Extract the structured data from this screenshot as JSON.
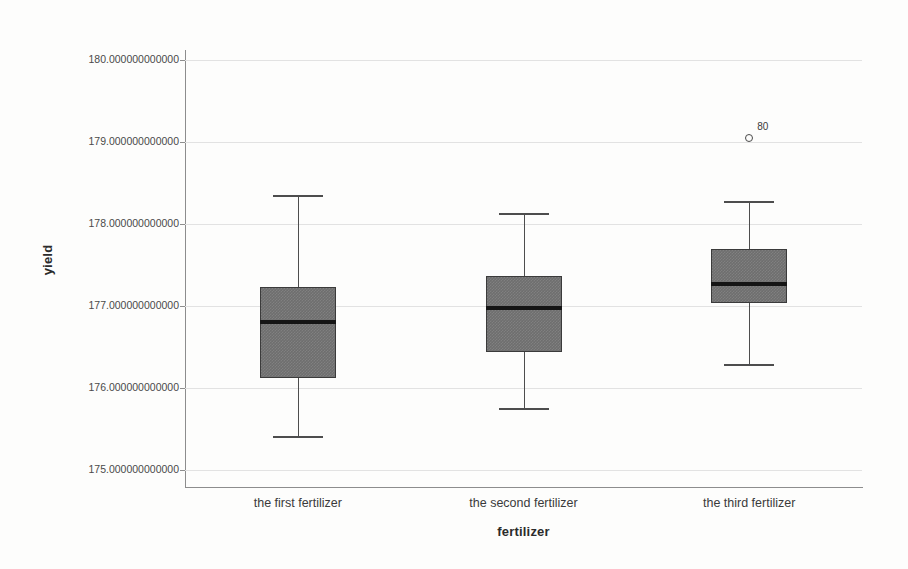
{
  "chart_data": {
    "type": "box",
    "title": "",
    "xlabel": "fertilizer",
    "ylabel": "yield",
    "categories": [
      "the first fertilizer",
      "the second fertilizer",
      "the third fertilizer"
    ],
    "ylim": [
      175.0,
      180.0
    ],
    "yticks": [
      "175.000000000000",
      "176.000000000000",
      "177.000000000000",
      "178.000000000000",
      "179.000000000000",
      "180.000000000000"
    ],
    "ytick_values": [
      175,
      176,
      177,
      178,
      179,
      180
    ],
    "grid": true,
    "legend": "none",
    "boxes": [
      {
        "category": "the first fertilizer",
        "whisker_low": 175.41,
        "q1": 176.12,
        "median": 176.8,
        "q3": 177.23,
        "whisker_high": 178.35,
        "outliers": []
      },
      {
        "category": "the second fertilizer",
        "whisker_low": 175.76,
        "q1": 176.44,
        "median": 176.98,
        "q3": 177.36,
        "whisker_high": 178.13,
        "outliers": []
      },
      {
        "category": "the third fertilizer",
        "whisker_low": 176.29,
        "q1": 177.04,
        "median": 177.27,
        "q3": 177.7,
        "whisker_high": 178.28,
        "outliers": [
          {
            "label": "80",
            "value": 179.05
          }
        ]
      }
    ],
    "colors": {
      "box_fill": "#6e6e6e",
      "box_border": "#3b3b3b",
      "median": "#151515",
      "whisker": "#4d4d4d",
      "gridline": "#e2e2e2",
      "axis": "#8d8d8d",
      "background": "#fdfdfc",
      "text": "#3a3a3a"
    }
  }
}
